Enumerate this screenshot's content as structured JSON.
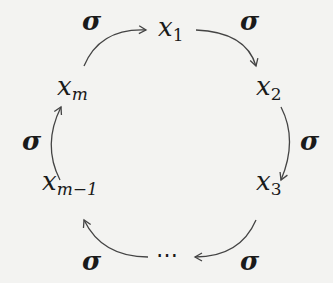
{
  "diagram": {
    "type": "cycle",
    "nodes": [
      {
        "id": "x1",
        "base": "x",
        "sub": "1"
      },
      {
        "id": "x2",
        "base": "x",
        "sub": "2"
      },
      {
        "id": "x3",
        "base": "x",
        "sub": "3"
      },
      {
        "id": "dots",
        "label": "⋯"
      },
      {
        "id": "xm1",
        "base": "x",
        "sub": "m−1"
      },
      {
        "id": "xm",
        "base": "x",
        "sub": "m"
      }
    ],
    "edges": [
      {
        "from": "xm",
        "to": "x1",
        "label": "σ"
      },
      {
        "from": "x1",
        "to": "x2",
        "label": "σ"
      },
      {
        "from": "x2",
        "to": "x3",
        "label": "σ"
      },
      {
        "from": "x3",
        "to": "dots",
        "label": "σ"
      },
      {
        "from": "dots",
        "to": "xm1",
        "label": "σ"
      },
      {
        "from": "xm1",
        "to": "xm",
        "label": "σ"
      }
    ],
    "colors": {
      "background": "#f3f3f1",
      "ink": "#1a1a1a",
      "arrow": "#444444"
    }
  }
}
